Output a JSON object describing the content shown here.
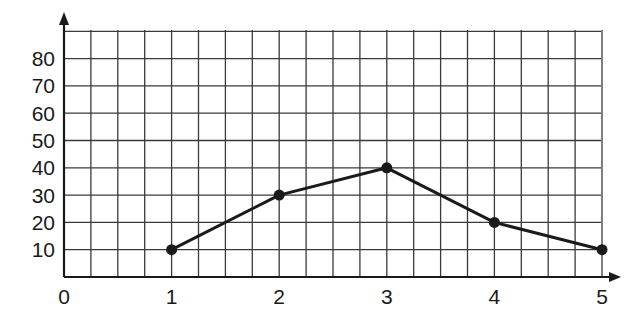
{
  "chart_data": {
    "type": "line",
    "title": "",
    "xlabel": "",
    "ylabel": "",
    "x": [
      1,
      2,
      3,
      4,
      5
    ],
    "values": [
      10,
      30,
      40,
      20,
      10
    ],
    "series": [
      {
        "name": "",
        "x": [
          1,
          2,
          3,
          4,
          5
        ],
        "values": [
          10,
          30,
          40,
          20,
          10
        ]
      }
    ],
    "x_ticks": [
      "0",
      "1",
      "2",
      "3",
      "4",
      "5"
    ],
    "y_ticks": [
      "10",
      "20",
      "30",
      "40",
      "50",
      "60",
      "70",
      "80"
    ],
    "xlim": [
      0,
      5
    ],
    "ylim": [
      0,
      90
    ],
    "grid": true,
    "grid_minor_x_per_unit": 4,
    "markers": "filled-circle",
    "legend": null,
    "colors": {
      "line": "#1a1a1a",
      "grid": "#3a3a3a",
      "background": "#ffffff"
    }
  }
}
